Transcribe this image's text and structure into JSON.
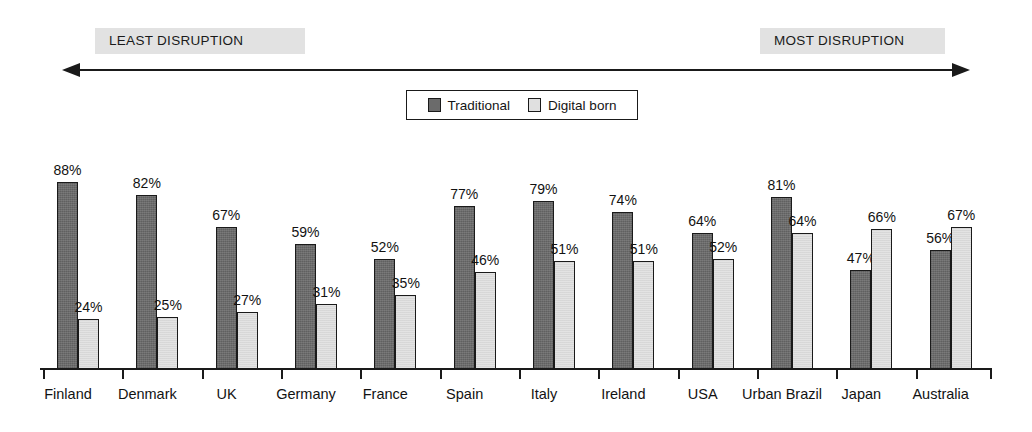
{
  "scale": {
    "least_label": "LEAST DISRUPTION",
    "most_label": "MOST DISRUPTION",
    "arrow_icon": "double-headed-arrow-icon"
  },
  "legend": {
    "entries": [
      {
        "label": "Traditional",
        "color": "#6b6b6b"
      },
      {
        "label": "Digital born",
        "color": "#e0e0e0"
      }
    ]
  },
  "chart_data": {
    "type": "bar",
    "title": "",
    "subtitle": "",
    "xlabel": "",
    "ylabel": "",
    "ylim": [
      0,
      100
    ],
    "grid": false,
    "legend_position": "top-center",
    "value_suffix": "%",
    "annotations": [
      "LEAST DISRUPTION",
      "MOST DISRUPTION"
    ],
    "categories": [
      "Finland",
      "Denmark",
      "UK",
      "Germany",
      "France",
      "Spain",
      "Italy",
      "Ireland",
      "USA",
      "Urban Brazil",
      "Japan",
      "Australia"
    ],
    "series": [
      {
        "name": "Traditional",
        "color": "#6b6b6b",
        "values": [
          88,
          82,
          67,
          59,
          52,
          77,
          79,
          74,
          64,
          81,
          47,
          56
        ],
        "labels": [
          "88%",
          "82%",
          "67%",
          "59%",
          "52%",
          "77%",
          "79%",
          "74%",
          "64%",
          "81%",
          "47%",
          "56%"
        ]
      },
      {
        "name": "Digital born",
        "color": "#e0e0e0",
        "values": [
          24,
          25,
          27,
          31,
          35,
          46,
          51,
          51,
          52,
          64,
          66,
          67
        ],
        "labels": [
          "24%",
          "25%",
          "27%",
          "31%",
          "35%",
          "46%",
          "51%",
          "51%",
          "52%",
          "64%",
          "66%",
          "67%"
        ]
      }
    ]
  }
}
